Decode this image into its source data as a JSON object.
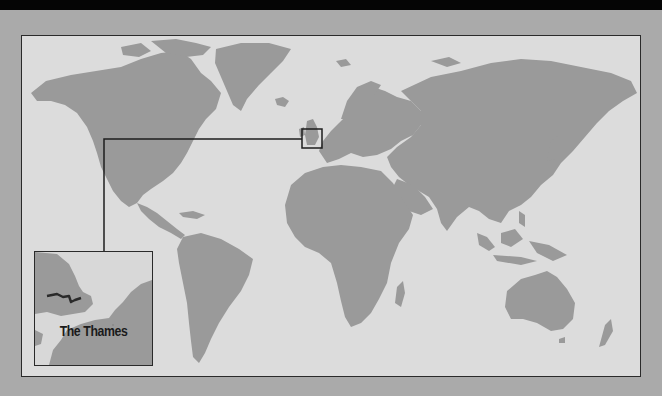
{
  "map": {
    "type": "world-locator-map",
    "colors": {
      "background": "#aaaaaa",
      "top_bar": "#050505",
      "ocean": "#dcdcdc",
      "land": "#9a9a9a",
      "frame": "#2a2a2a",
      "river": "#2a2a2a"
    },
    "highlight_region": "Southern England / Thames estuary",
    "inset": {
      "label": "The Thames"
    }
  }
}
